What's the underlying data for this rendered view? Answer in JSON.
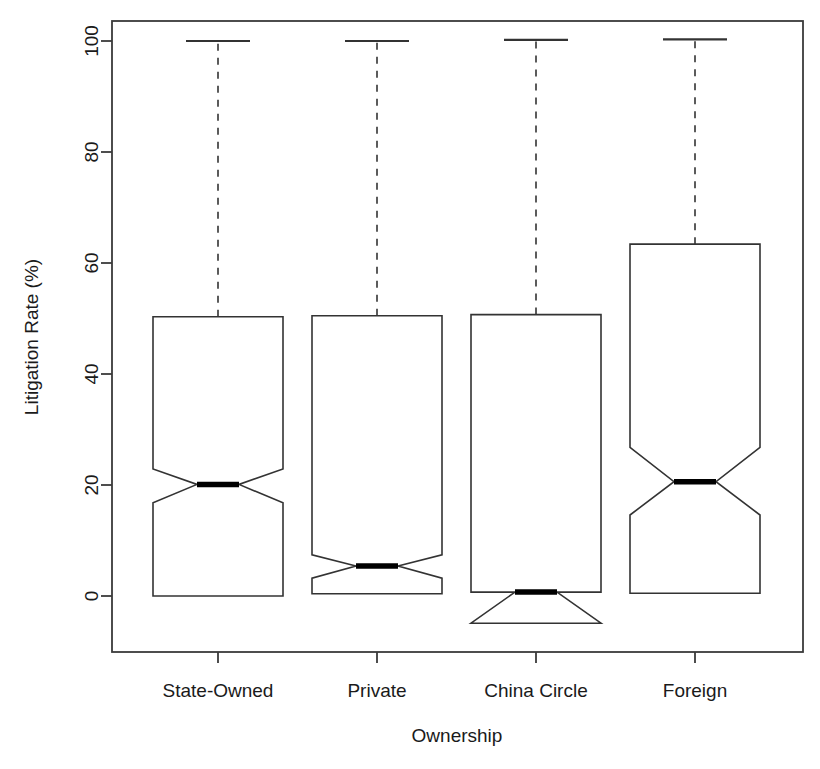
{
  "chart_data": {
    "type": "boxplot",
    "title": "",
    "xlabel": "Ownership",
    "ylabel": "Litigation Rate (%)",
    "categories": [
      "State-Owned",
      "Private",
      "China Circle",
      "Foreign"
    ],
    "ytick_labels": [
      "0",
      "20",
      "40",
      "60",
      "80",
      "100"
    ],
    "ytick_values": [
      0,
      20,
      40,
      60,
      80,
      100
    ],
    "ylim": [
      -9.5,
      107
    ],
    "xlim": [
      0.5,
      4.5
    ],
    "grid": false,
    "legend": null,
    "notched": true,
    "box_fill": "#ffffff",
    "box_stroke": "#333333",
    "median_color": "#000000",
    "whisker_style": "dashed",
    "axis_color": "#3a3a3a",
    "boxes": [
      {
        "category": "State-Owned",
        "lower_whisker": 0.0,
        "q1": 0.0,
        "median": 20.1,
        "q3": 50.3,
        "upper_whisker": 100.0,
        "notch_lower": 16.8,
        "notch_upper": 22.9,
        "outliers": []
      },
      {
        "category": "Private",
        "lower_whisker": 0.4,
        "q1": 0.4,
        "median": 5.4,
        "q3": 50.5,
        "upper_whisker": 100.0,
        "notch_lower": 3.2,
        "notch_upper": 7.4,
        "outliers": []
      },
      {
        "category": "China Circle",
        "lower_whisker": -4.9,
        "q1": -4.9,
        "median": 0.7,
        "q3": 50.7,
        "upper_whisker": 100.2,
        "notch_lower": -4.9,
        "notch_upper": 0.7,
        "outliers": []
      },
      {
        "category": "Foreign",
        "lower_whisker": 0.5,
        "q1": 0.5,
        "median": 20.6,
        "q3": 63.4,
        "upper_whisker": 100.3,
        "notch_lower": 14.6,
        "notch_upper": 26.8,
        "outliers": []
      }
    ]
  },
  "axes": {
    "y_title": "Litigation Rate (%)",
    "x_title": "Ownership"
  }
}
